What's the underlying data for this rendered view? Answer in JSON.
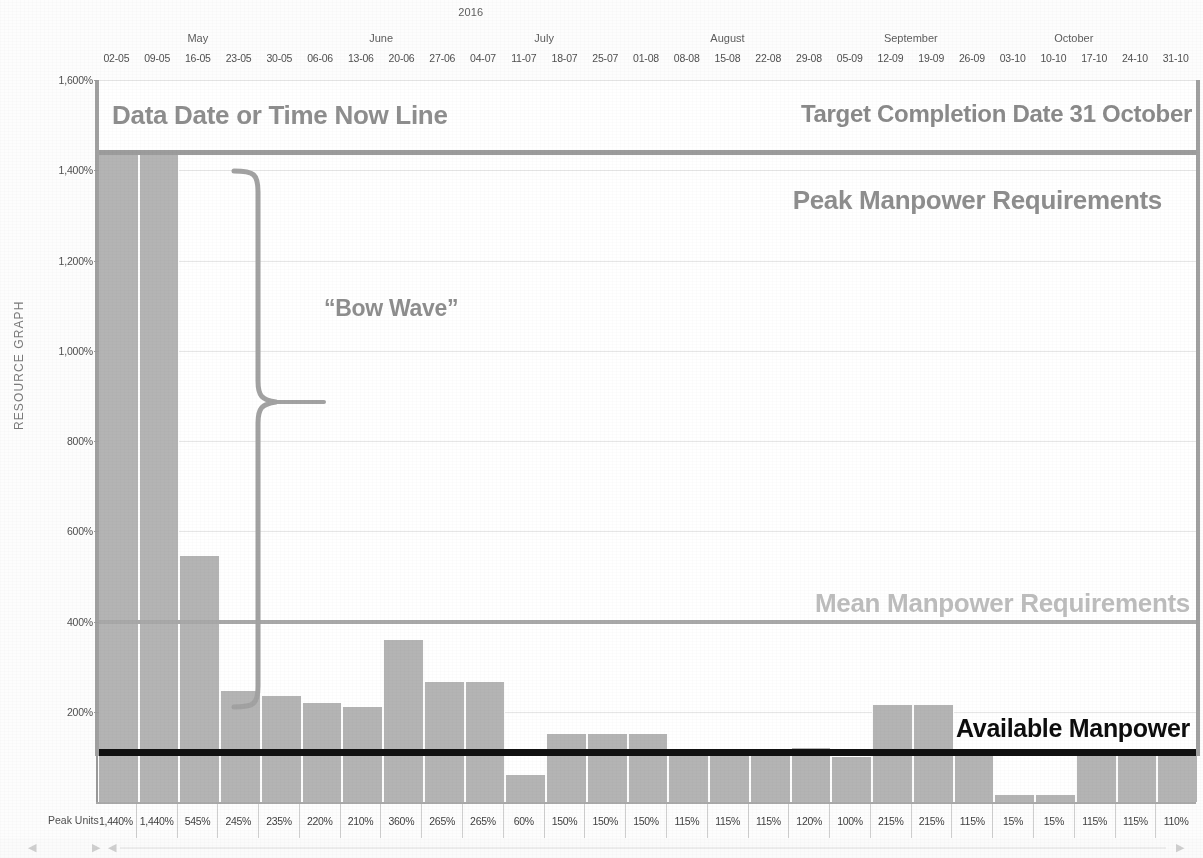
{
  "axis": {
    "y_title": "RESOURCE GRAPH",
    "y_ticks": [
      "1,600%",
      "1,400%",
      "1,200%",
      "1,000%",
      "800%",
      "600%",
      "400%",
      "200%"
    ],
    "year": "2016",
    "peak_units_label": "Peak Units"
  },
  "annotations": {
    "data_date": "Data Date or Time Now Line",
    "target_completion": "Target Completion Date 31 October",
    "peak_manpower": "Peak Manpower Requirements",
    "mean_manpower": "Mean Manpower Requirements",
    "available_manpower": "Available Manpower",
    "bow_wave": "“Bow Wave”"
  },
  "colors": {
    "bar": "#b4b4b4",
    "peak_line": "#9c9c9c",
    "mean_line": "#a8a8a8",
    "available_line": "#111111",
    "grid": "#e6e6e6",
    "text": "#6b6b6b",
    "available_text": "#0d0d0d",
    "mean_text": "#bdbdbd"
  },
  "months": [
    {
      "name": "May",
      "start": 0,
      "span": 5
    },
    {
      "name": "June",
      "start": 5,
      "span": 4
    },
    {
      "name": "July",
      "start": 9,
      "span": 4
    },
    {
      "name": "August",
      "start": 13,
      "span": 5
    },
    {
      "name": "September",
      "start": 18,
      "span": 4
    },
    {
      "name": "October",
      "start": 22,
      "span": 4
    }
  ],
  "chart_data": {
    "type": "bar",
    "title": "RESOURCE GRAPH",
    "subtitle": "2016",
    "xlabel": "",
    "ylabel": "RESOURCE GRAPH",
    "ylim": [
      0,
      1600
    ],
    "grid": true,
    "legend": "none",
    "categories": [
      "02-05",
      "09-05",
      "16-05",
      "23-05",
      "30-05",
      "06-06",
      "13-06",
      "20-06",
      "27-06",
      "04-07",
      "11-07",
      "18-07",
      "25-07",
      "01-08",
      "08-08",
      "15-08",
      "22-08",
      "29-08",
      "05-09",
      "12-09",
      "19-09",
      "26-09",
      "03-10",
      "10-10",
      "17-10",
      "24-10",
      "31-10"
    ],
    "values": [
      1440,
      1440,
      545,
      245,
      235,
      220,
      210,
      360,
      265,
      265,
      60,
      150,
      150,
      150,
      115,
      115,
      115,
      120,
      100,
      215,
      215,
      115,
      15,
      15,
      115,
      115,
      110
    ],
    "value_labels": [
      "1,440%",
      "1,440%",
      "545%",
      "245%",
      "235%",
      "220%",
      "210%",
      "360%",
      "265%",
      "265%",
      "60%",
      "150%",
      "150%",
      "150%",
      "115%",
      "115%",
      "115%",
      "120%",
      "100%",
      "215%",
      "215%",
      "115%",
      "15%",
      "15%",
      "115%",
      "115%",
      "110%"
    ],
    "tick_values": [
      1600,
      1400,
      1200,
      1000,
      800,
      600,
      400,
      200
    ],
    "reference_lines": [
      {
        "name": "Peak Manpower Requirements",
        "value": 1440,
        "color": "#9c9c9c"
      },
      {
        "name": "Mean Manpower Requirements",
        "value": 400,
        "color": "#a8a8a8"
      },
      {
        "name": "Available Manpower",
        "value": 110,
        "color": "#111111"
      }
    ]
  }
}
